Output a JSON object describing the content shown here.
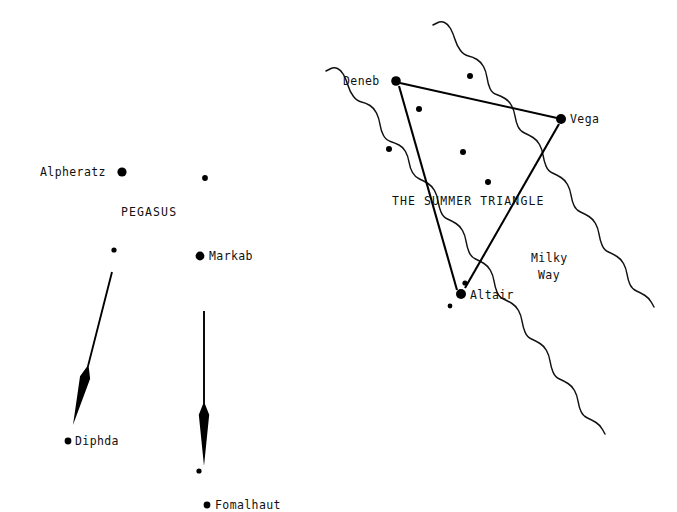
{
  "chart": {
    "background_color": "#ffffff",
    "ink_color": "#000000",
    "width": 677,
    "height": 512
  },
  "labels": {
    "alpheratz": "Alpheratz",
    "pegasus": "PEGASUS",
    "markab": "Markab",
    "diphda": "Diphda",
    "fomalhaut": "Fomalhaut",
    "deneb": "Deneb",
    "vega": "Vega",
    "altair": "Altair",
    "summer_triangle": "THE SUMMER TRIANGLE",
    "milky_way_line1": "Milky",
    "milky_way_line2": "Way"
  },
  "named_stars": [
    {
      "name": "Alpheratz",
      "x": 122,
      "y": 172,
      "r": 4.6,
      "label_x": 40,
      "label_y": 176,
      "label_anchor": "start"
    },
    {
      "name": "Markab",
      "x": 200,
      "y": 256,
      "r": 4.4,
      "label_x": 209,
      "label_y": 260,
      "label_anchor": "start"
    },
    {
      "name": "Diphda",
      "x": 68,
      "y": 441,
      "r": 3.4,
      "label_x": 75,
      "label_y": 445,
      "label_anchor": "start"
    },
    {
      "name": "Fomalhaut",
      "x": 207,
      "y": 505,
      "r": 3.4,
      "label_x": 215,
      "label_y": 509,
      "label_anchor": "start"
    },
    {
      "name": "Deneb",
      "x": 396,
      "y": 81,
      "r": 4.8,
      "label_x": 343,
      "label_y": 85,
      "label_anchor": "start"
    },
    {
      "name": "Vega",
      "x": 561,
      "y": 119,
      "r": 5.0,
      "label_x": 570,
      "label_y": 123,
      "label_anchor": "start"
    },
    {
      "name": "Altair",
      "x": 461,
      "y": 294,
      "r": 5.0,
      "label_x": 470,
      "label_y": 299,
      "label_anchor": "start"
    }
  ],
  "field_stars": [
    {
      "x": 205,
      "y": 178,
      "r": 2.9
    },
    {
      "x": 114,
      "y": 250,
      "r": 2.6
    },
    {
      "x": 199,
      "y": 471,
      "r": 2.6
    },
    {
      "x": 470,
      "y": 76,
      "r": 3.0
    },
    {
      "x": 419,
      "y": 109,
      "r": 3.0
    },
    {
      "x": 389,
      "y": 149,
      "r": 3.0
    },
    {
      "x": 463,
      "y": 152,
      "r": 3.0
    },
    {
      "x": 488,
      "y": 182,
      "r": 3.0
    },
    {
      "x": 465,
      "y": 283,
      "r": 2.6
    },
    {
      "x": 450,
      "y": 306,
      "r": 2.4
    }
  ],
  "triangle_lines": [
    {
      "name": "deneb-vega",
      "x1": 400,
      "y1": 83,
      "x2": 557,
      "y2": 118,
      "width": 2.0
    },
    {
      "name": "deneb-altair",
      "x1": 399,
      "y1": 86,
      "x2": 457,
      "y2": 290,
      "width": 2.1
    },
    {
      "name": "vega-altair",
      "x1": 559,
      "y1": 124,
      "x2": 465,
      "y2": 288,
      "width": 2.1
    }
  ],
  "pointer_arrows": [
    {
      "name": "pegasus-to-diphda",
      "tail_x": 112,
      "tail_y": 272,
      "head_x": 73,
      "head_y": 425,
      "flare_t": 0.62,
      "half_width": 5.2,
      "shaft_width": 1.9
    },
    {
      "name": "pegasus-to-fomalhaut",
      "tail_x": 204,
      "tail_y": 311,
      "head_x": 204,
      "head_y": 466,
      "flare_t": 0.6,
      "half_width": 5.2,
      "shaft_width": 1.9
    }
  ],
  "milky_way_bands": [
    {
      "name": "left-edge",
      "points": "326,71 334,67 341,70 346,79 350,92 357,101 366,103 374,108 379,118 381,131 386,140 395,143 403,147 408,156 410,168 415,177 424,181 432,186 437,195 439,207 443,217 452,221 460,226 465,235 467,247 471,257 480,261 488,266 493,275 495,287 499,297 508,301 516,306 521,315 523,327 527,337 536,341 544,346 549,355 551,367 555,377 564,381 572,386 577,395 579,407 583,416 592,420 600,425 605,434"
    },
    {
      "name": "right-edge",
      "points": "433,25 441,21 448,24 453,33 457,46 464,55 473,57 481,62 486,71 488,84 492,93 501,96 509,101 514,110 516,122 520,131 529,135 537,140 542,149 544,161 548,171 557,175 565,180 570,189 572,201 576,210 585,214 593,219 598,228 600,240 604,250 613,254 621,259 626,268 628,280 632,289 641,293 649,298 654,307"
    }
  ],
  "text_annotations": [
    {
      "name": "pegasus",
      "text": "PEGASUS",
      "x": 121,
      "y": 216,
      "anchor": "start",
      "style": "const"
    },
    {
      "name": "summer-triangle",
      "text": "THE SUMMER TRIANGLE",
      "x": 392,
      "y": 205,
      "anchor": "start",
      "style": "const"
    },
    {
      "name": "milky-way-1",
      "text": "Milky",
      "x": 531,
      "y": 262,
      "anchor": "start",
      "style": "mw"
    },
    {
      "name": "milky-way-2",
      "text": "Way",
      "x": 538,
      "y": 279,
      "anchor": "start",
      "style": "mw"
    }
  ]
}
